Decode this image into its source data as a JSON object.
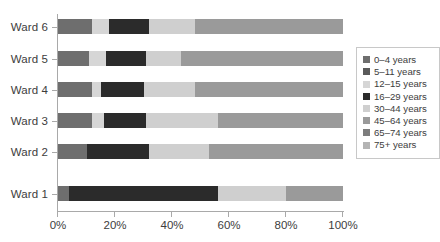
{
  "chart_data": {
    "type": "bar",
    "orientation": "horizontal",
    "stacked": true,
    "title": "",
    "xlabel": "",
    "ylabel": "",
    "xlim": [
      0,
      100
    ],
    "grid": false,
    "legend_position": "right",
    "categories": [
      "Ward 1",
      "Ward 2",
      "Ward 3",
      "Ward 4",
      "Ward 5",
      "Ward 6"
    ],
    "x_ticks": [
      "0%",
      "20%",
      "40%",
      "60%",
      "80%",
      "100%"
    ],
    "x_tick_values": [
      0,
      20,
      40,
      60,
      80,
      100
    ],
    "series": [
      {
        "name": "0–4 years",
        "color": "#6e6e6e",
        "values": [
          4,
          10,
          12,
          12,
          11,
          12
        ]
      },
      {
        "name": "5–11 years",
        "color": "#5a5a5a",
        "values": [
          0,
          0,
          0,
          0,
          0,
          0
        ]
      },
      {
        "name": "12–15 years",
        "color": "#d6d6d6",
        "values": [
          0,
          0,
          4,
          3,
          6,
          6
        ]
      },
      {
        "name": "16–29 years",
        "color": "#2b2b2b",
        "values": [
          52,
          22,
          15,
          15,
          14,
          14
        ]
      },
      {
        "name": "30–44 years",
        "color": "#cfcfcf",
        "values": [
          24,
          21,
          25,
          18,
          12,
          16
        ]
      },
      {
        "name": "45–64 years",
        "color": "#9a9a9a",
        "values": [
          20,
          47,
          44,
          52,
          57,
          52
        ]
      },
      {
        "name": "65–74 years",
        "color": "#7d7d7d",
        "values": [
          0,
          0,
          0,
          0,
          0,
          0
        ]
      },
      {
        "name": "75+ years",
        "color": "#b4b4b4",
        "values": [
          0,
          0,
          0,
          0,
          0,
          0
        ]
      }
    ]
  },
  "legend": {
    "items": [
      {
        "label": "0–4 years",
        "color": "#6e6e6e"
      },
      {
        "label": "5–11 years",
        "color": "#5a5a5a"
      },
      {
        "label": "12–15 years",
        "color": "#d6d6d6"
      },
      {
        "label": "16–29 years",
        "color": "#2b2b2b"
      },
      {
        "label": "30–44 years",
        "color": "#cfcfcf"
      },
      {
        "label": "45–64 years",
        "color": "#9a9a9a"
      },
      {
        "label": "65–74 years",
        "color": "#7d7d7d"
      },
      {
        "label": "75+ years",
        "color": "#b4b4b4"
      }
    ]
  },
  "axis": {
    "line_color": "#a9a9a9",
    "text_color": "#3d3d3d"
  }
}
